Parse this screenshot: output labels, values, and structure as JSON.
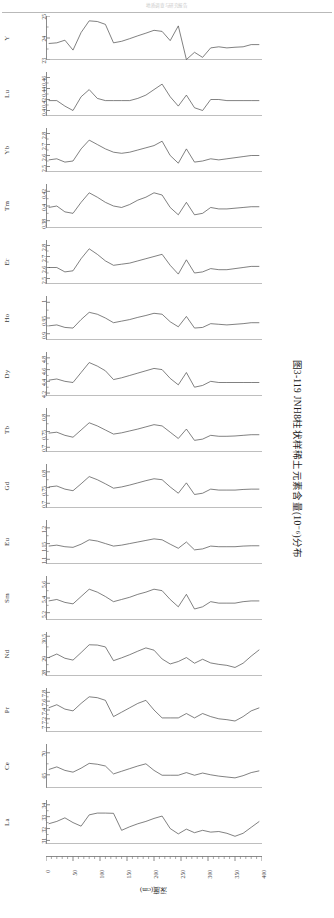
{
  "header": {
    "text": "地质调查与研究报告"
  },
  "caption": {
    "text": "图3-119  JNH8柱状样稀土元素含量(10⁻⁶)分布"
  },
  "axis": {
    "xlabel": "深度(cm)",
    "xticks": [
      0,
      50,
      100,
      150,
      200,
      250,
      300,
      350,
      400
    ],
    "xlim": [
      0,
      400
    ],
    "xminor_step": 10
  },
  "chart_data": {
    "type": "line",
    "title": "图3-119  JNH8柱状样稀土元素含量(10⁻⁶)分布",
    "xlabel": "深度(cm)",
    "ylabel": "",
    "grid": false,
    "legend": "none",
    "x": [
      5,
      20,
      35,
      50,
      65,
      80,
      95,
      110,
      125,
      140,
      155,
      170,
      185,
      200,
      215,
      230,
      245,
      260,
      275,
      290,
      305,
      320,
      335,
      350,
      365,
      380,
      395
    ],
    "panels": [
      {
        "name": "Y",
        "ylim": [
          23,
          25
        ],
        "yticks": [
          23,
          24,
          25
        ],
        "ytick_labels": [
          "23",
          "24",
          "25"
        ],
        "values": [
          23.75,
          23.78,
          23.9,
          23.45,
          24.25,
          24.78,
          24.75,
          24.62,
          23.78,
          23.85,
          23.97,
          24.1,
          24.22,
          24.35,
          24.3,
          23.88,
          24.55,
          23.02,
          23.35,
          23.12,
          23.55,
          23.6,
          23.55,
          23.58,
          23.6,
          23.7,
          23.7
        ]
      },
      {
        "name": "Lu",
        "ylim": [
          0.39,
          0.47
        ],
        "yticks": [
          0.4,
          0.42,
          0.44,
          0.46
        ],
        "ytick_labels": [
          "0.4",
          "0.42",
          "0.44",
          "0.46"
        ],
        "values": [
          0.418,
          0.418,
          0.408,
          0.4,
          0.425,
          0.438,
          0.422,
          0.418,
          0.418,
          0.418,
          0.418,
          0.422,
          0.428,
          0.438,
          0.448,
          0.425,
          0.408,
          0.428,
          0.405,
          0.4,
          0.42,
          0.42,
          0.418,
          0.418,
          0.418,
          0.418,
          0.418
        ]
      },
      {
        "name": "Yb",
        "ylim": [
          2.45,
          2.85
        ],
        "yticks": [
          2.5,
          2.6,
          2.7,
          2.8
        ],
        "ytick_labels": [
          "2.5",
          "2.6",
          "2.7",
          "2.8"
        ],
        "values": [
          2.56,
          2.57,
          2.54,
          2.55,
          2.66,
          2.74,
          2.7,
          2.66,
          2.63,
          2.62,
          2.63,
          2.65,
          2.67,
          2.69,
          2.73,
          2.6,
          2.53,
          2.66,
          2.54,
          2.55,
          2.57,
          2.56,
          2.57,
          2.58,
          2.59,
          2.6,
          2.6
        ]
      },
      {
        "name": "Tm",
        "ylim": [
          0.37,
          0.43
        ],
        "yticks": [
          0.38,
          0.4,
          0.42
        ],
        "ytick_labels": [
          "0.38",
          "0.4",
          "0.42"
        ],
        "values": [
          0.398,
          0.4,
          0.392,
          0.39,
          0.405,
          0.418,
          0.412,
          0.405,
          0.4,
          0.398,
          0.402,
          0.408,
          0.412,
          0.418,
          0.415,
          0.398,
          0.388,
          0.405,
          0.388,
          0.39,
          0.398,
          0.396,
          0.396,
          0.397,
          0.398,
          0.399,
          0.399
        ]
      },
      {
        "name": "Er",
        "ylim": [
          2.45,
          2.85
        ],
        "yticks": [
          2.5,
          2.6,
          2.7,
          2.8
        ],
        "ytick_labels": [
          "2.5",
          "2.6",
          "2.7",
          "2.8"
        ],
        "values": [
          2.6,
          2.6,
          2.56,
          2.57,
          2.68,
          2.77,
          2.72,
          2.66,
          2.62,
          2.63,
          2.64,
          2.66,
          2.68,
          2.7,
          2.72,
          2.62,
          2.54,
          2.67,
          2.55,
          2.56,
          2.59,
          2.58,
          2.58,
          2.59,
          2.6,
          2.61,
          2.61
        ]
      },
      {
        "name": "Ho",
        "ylim": [
          0.88,
          1.02
        ],
        "yticks": [
          0.9,
          0.95,
          1
        ],
        "ytick_labels": [
          "0.9",
          "0.95",
          "1"
        ],
        "values": [
          0.925,
          0.928,
          0.92,
          0.918,
          0.945,
          0.968,
          0.962,
          0.95,
          0.935,
          0.94,
          0.945,
          0.952,
          0.958,
          0.965,
          0.962,
          0.938,
          0.922,
          0.955,
          0.918,
          0.92,
          0.932,
          0.93,
          0.928,
          0.93,
          0.932,
          0.935,
          0.935
        ]
      },
      {
        "name": "Dy",
        "ylim": [
          4.15,
          4.9
        ],
        "yticks": [
          4.2,
          4.4,
          4.6,
          4.8
        ],
        "ytick_labels": [
          "4.2",
          "4.4",
          "4.6",
          "4.8"
        ],
        "values": [
          4.42,
          4.44,
          4.4,
          4.38,
          4.55,
          4.72,
          4.66,
          4.58,
          4.43,
          4.46,
          4.5,
          4.54,
          4.58,
          4.62,
          4.6,
          4.45,
          4.34,
          4.55,
          4.3,
          4.33,
          4.4,
          4.38,
          4.38,
          4.38,
          4.38,
          4.38,
          4.38
        ]
      },
      {
        "name": "Tb",
        "ylim": [
          0.685,
          0.825
        ],
        "yticks": [
          0.7,
          0.75,
          0.8
        ],
        "ytick_labels": [
          "0.7",
          "0.75",
          "0.8"
        ],
        "values": [
          0.745,
          0.748,
          0.738,
          0.732,
          0.755,
          0.778,
          0.768,
          0.755,
          0.742,
          0.746,
          0.752,
          0.758,
          0.765,
          0.772,
          0.768,
          0.748,
          0.728,
          0.758,
          0.722,
          0.726,
          0.738,
          0.735,
          0.735,
          0.736,
          0.738,
          0.74,
          0.74
        ]
      },
      {
        "name": "Gd",
        "ylim": [
          0.685,
          0.825
        ],
        "yticks": [
          0.7,
          0.75,
          0.8
        ],
        "ytick_labels": [
          "0.7",
          "0.75",
          "0.8"
        ],
        "values": [
          0.752,
          0.755,
          0.745,
          0.74,
          0.762,
          0.785,
          0.775,
          0.762,
          0.748,
          0.752,
          0.758,
          0.765,
          0.772,
          0.778,
          0.775,
          0.752,
          0.732,
          0.765,
          0.728,
          0.732,
          0.745,
          0.742,
          0.742,
          0.742,
          0.744,
          0.745,
          0.745
        ]
      },
      {
        "name": "Eu",
        "ylim": [
          1.085,
          1.225
        ],
        "yticks": [
          1.1,
          1.15,
          1.2
        ],
        "ytick_labels": [
          "1.1",
          "1.15",
          "1.2"
        ],
        "values": [
          1.142,
          1.145,
          1.14,
          1.138,
          1.148,
          1.162,
          1.158,
          1.15,
          1.142,
          1.145,
          1.15,
          1.155,
          1.16,
          1.165,
          1.162,
          1.148,
          1.135,
          1.155,
          1.13,
          1.133,
          1.142,
          1.14,
          1.14,
          1.14,
          1.142,
          1.143,
          1.143
        ]
      },
      {
        "name": "Sm",
        "ylim": [
          5.1,
          5.7
        ],
        "yticks": [
          5.2,
          5.4,
          5.6
        ],
        "ytick_labels": [
          "5.2",
          "5.4",
          "5.6"
        ],
        "values": [
          5.36,
          5.38,
          5.34,
          5.32,
          5.42,
          5.52,
          5.48,
          5.42,
          5.35,
          5.38,
          5.41,
          5.45,
          5.48,
          5.52,
          5.5,
          5.38,
          5.28,
          5.45,
          5.25,
          5.28,
          5.35,
          5.33,
          5.33,
          5.33,
          5.35,
          5.36,
          5.36
        ]
      },
      {
        "name": "Nd",
        "ylim": [
          27.7,
          30.8
        ],
        "yticks": [
          28,
          29,
          30.5
        ],
        "ytick_labels": [
          "28",
          "29",
          "30.5"
        ],
        "values": [
          29.0,
          29.25,
          28.95,
          28.82,
          29.35,
          29.9,
          29.88,
          29.75,
          28.78,
          28.98,
          29.2,
          29.45,
          29.68,
          29.52,
          28.9,
          28.55,
          28.72,
          29.0,
          28.6,
          28.88,
          28.62,
          28.52,
          28.45,
          28.3,
          28.6,
          29.1,
          29.55
        ]
      },
      {
        "name": "Pr",
        "ylim": [
          6.9,
          7.9
        ],
        "yticks": [
          7.0,
          7.2,
          7.4,
          7.6,
          7.8
        ],
        "ytick_labels": [
          "7",
          "7.2",
          "7.4",
          "7.6",
          "7.8"
        ],
        "values": [
          7.45,
          7.52,
          7.42,
          7.38,
          7.55,
          7.7,
          7.68,
          7.62,
          7.25,
          7.35,
          7.45,
          7.55,
          7.62,
          7.4,
          7.22,
          7.22,
          7.22,
          7.32,
          7.22,
          7.32,
          7.25,
          7.2,
          7.18,
          7.15,
          7.25,
          7.38,
          7.45
        ]
      },
      {
        "name": "Ce",
        "ylim": [
          62,
          72
        ],
        "yticks": [
          65,
          70
        ],
        "ytick_labels": [
          "65",
          "70"
        ],
        "values": [
          66.2,
          66.8,
          66.0,
          65.6,
          66.5,
          67.6,
          67.4,
          67.0,
          65.2,
          65.8,
          66.4,
          67.0,
          67.5,
          66.0,
          64.9,
          64.9,
          64.9,
          65.5,
          64.9,
          65.4,
          65.0,
          64.7,
          64.5,
          64.3,
          64.8,
          65.5,
          65.9
        ]
      },
      {
        "name": "La",
        "ylim": [
          30.7,
          34.4
        ],
        "yticks": [
          31,
          32,
          33,
          34
        ],
        "ytick_labels": [
          "31",
          "32",
          "33",
          "34"
        ],
        "values": [
          32.4,
          32.6,
          32.9,
          32.5,
          32.2,
          33.15,
          33.3,
          33.3,
          33.28,
          31.85,
          32.15,
          32.4,
          32.6,
          32.85,
          33.05,
          32.0,
          31.55,
          31.95,
          31.65,
          31.85,
          31.7,
          31.75,
          31.6,
          31.35,
          31.6,
          32.1,
          32.6
        ]
      }
    ]
  }
}
